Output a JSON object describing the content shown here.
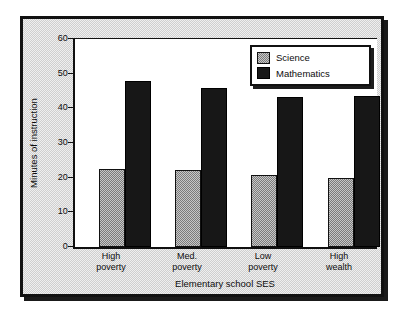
{
  "chart_data": {
    "type": "bar",
    "title": "",
    "xlabel": "Elementary school SES",
    "ylabel": "Minutes of instruction",
    "categories": [
      "High poverty",
      "Med. poverty",
      "Low poverty",
      "High wealth"
    ],
    "category_lines": [
      [
        "High",
        "poverty"
      ],
      [
        "Med.",
        "poverty"
      ],
      [
        "Low",
        "poverty"
      ],
      [
        "High",
        "wealth"
      ]
    ],
    "series": [
      {
        "name": "Science",
        "values": [
          22.5,
          22.2,
          20.8,
          19.8
        ],
        "color": "#a0a0a0"
      },
      {
        "name": "Mathematics",
        "values": [
          48.0,
          46.0,
          43.2,
          43.6
        ],
        "color": "#171717"
      }
    ],
    "ylim": [
      0,
      60
    ],
    "yticks": [
      0,
      10,
      20,
      30,
      40,
      50,
      60
    ],
    "ytick_labels": [
      "0",
      "10",
      "20",
      "30",
      "40",
      "50",
      "60"
    ],
    "grid": false,
    "legend_position": "top-right"
  }
}
